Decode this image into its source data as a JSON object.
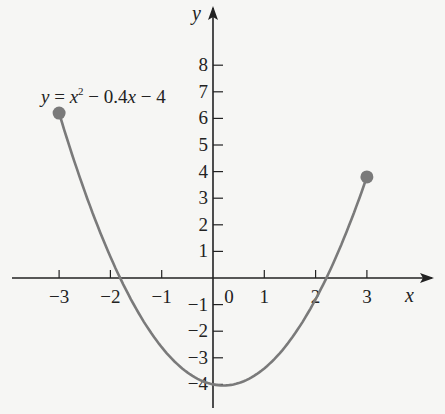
{
  "chart_data": {
    "type": "line",
    "title": "",
    "equation_label": "y = x² − 0.4x − 4",
    "equation_parts": {
      "y": "y",
      "eq": " = ",
      "x": "x",
      "sup": "2",
      "rest1": " − 0.4",
      "x2": "x",
      "rest2": " − 4"
    },
    "xlabel": "x",
    "ylabel": "y",
    "xlim": [
      -3.9,
      3.8
    ],
    "ylim": [
      -5,
      9
    ],
    "x_ticks": [
      -3,
      -2,
      -1,
      0,
      1,
      2,
      3
    ],
    "x_tick_labels": [
      "−3",
      "−2",
      "−1",
      "0",
      "1",
      "2",
      "3"
    ],
    "y_ticks": [
      -4,
      -3,
      -2,
      -1,
      1,
      2,
      3,
      4,
      5,
      6,
      7,
      8
    ],
    "y_tick_labels": [
      "−4",
      "−3",
      "−2",
      "−1",
      "1",
      "2",
      "3",
      "4",
      "5",
      "6",
      "7",
      "8"
    ],
    "grid": false,
    "series": [
      {
        "name": "y = x^2 - 0.4x - 4",
        "domain": [
          -3,
          3
        ],
        "x": [
          -3,
          -2.5,
          -2,
          -1.5,
          -1,
          -0.5,
          0,
          0.2,
          0.5,
          1,
          1.5,
          2,
          2.5,
          3
        ],
        "values": [
          6.2,
          3.25,
          0.8,
          -1.15,
          -2.6,
          -3.55,
          -4,
          -4.04,
          -3.95,
          -3.4,
          -2.35,
          -0.8,
          1.25,
          3.8
        ],
        "color": "#7a7a7a",
        "endpoints": [
          {
            "x": -3,
            "y": 6.2,
            "marker": "filled-circle"
          },
          {
            "x": 3,
            "y": 3.8,
            "marker": "filled-circle"
          }
        ]
      }
    ]
  },
  "colors": {
    "curve": "#7a7a7a",
    "axis": "#222222",
    "background": "#f6f6f4"
  }
}
